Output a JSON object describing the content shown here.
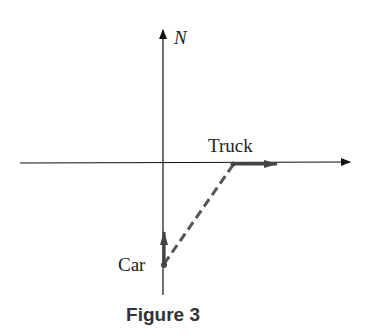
{
  "diagram": {
    "axis_label_north": "N",
    "truck_label": "Truck",
    "car_label": "Car",
    "caption": "Figure 3",
    "colors": {
      "axis": "#111111",
      "vector": "#444444",
      "dashed": "#555555"
    }
  }
}
